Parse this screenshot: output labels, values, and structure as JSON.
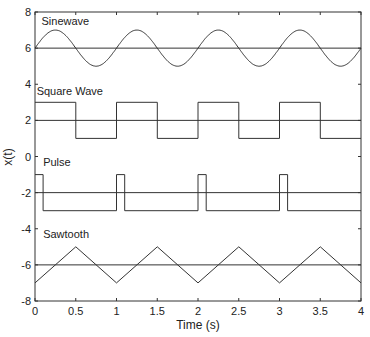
{
  "chart_data": {
    "type": "line",
    "title": "",
    "xlabel": "Time (s)",
    "ylabel": "x(t)",
    "xlim": [
      0,
      4
    ],
    "ylim": [
      -8,
      8
    ],
    "xticks": [
      0,
      0.5,
      1,
      1.5,
      2,
      2.5,
      3,
      3.5,
      4
    ],
    "xtick_labels": [
      "0",
      "0.5",
      "1",
      "1.5",
      "2",
      "2.5",
      "3",
      "3.5",
      "4"
    ],
    "yticks": [
      -8,
      -6,
      -4,
      -2,
      0,
      2,
      4,
      6,
      8
    ],
    "ytick_labels": [
      "-8",
      "-6",
      "-4",
      "-2",
      "0",
      "2",
      "4",
      "6",
      "8"
    ],
    "grid": false,
    "legend": null,
    "annotations": [
      {
        "text": "Sinewave",
        "x": 0.08,
        "y": 7.5
      },
      {
        "text": "Square Wave",
        "x": 0.02,
        "y": 3.6
      },
      {
        "text": "Pulse",
        "x": 0.1,
        "y": -0.3
      },
      {
        "text": "Sawtooth",
        "x": 0.1,
        "y": -4.3
      }
    ],
    "series": [
      {
        "name": "Sinewave",
        "kind": "sine",
        "offset": 6,
        "amplitude": 1,
        "frequency_hz": 1,
        "baseline": 6
      },
      {
        "name": "Square Wave",
        "kind": "square",
        "offset": 2,
        "high": 3,
        "low": 1,
        "period": 1,
        "duty": 0.5,
        "baseline": 2
      },
      {
        "name": "Pulse",
        "kind": "pulse",
        "offset": -2,
        "high": -1,
        "low": -3,
        "period": 1,
        "width": 0.1,
        "baseline": -2
      },
      {
        "name": "Sawtooth",
        "kind": "triangle",
        "offset": -6,
        "high": -5,
        "low": -7,
        "period": 1,
        "baseline": -6
      }
    ]
  }
}
